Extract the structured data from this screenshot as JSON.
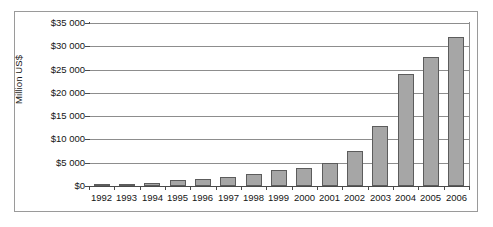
{
  "chart_data": {
    "type": "bar",
    "title": "",
    "subtitle": "",
    "xlabel": "",
    "ylabel": "Million US$",
    "grid": true,
    "legend": false,
    "legend_position": "none",
    "ylim": [
      0,
      35000
    ],
    "y_tick_step": 5000,
    "categories": [
      "1992",
      "1993",
      "1994",
      "1995",
      "1996",
      "1997",
      "1998",
      "1999",
      "2000",
      "2001",
      "2002",
      "2003",
      "2004",
      "2005",
      "2006"
    ],
    "values": [
      100,
      150,
      600,
      1200,
      1400,
      2000,
      2600,
      3400,
      3900,
      5000,
      7500,
      12900,
      24100,
      27600,
      32000
    ],
    "y_tick_labels": [
      "$35 000",
      "$30 000",
      "$25 000",
      "$20 000",
      "$15 000",
      "$10 000",
      "$5 000",
      "$0"
    ],
    "y_tick_values": [
      35000,
      30000,
      25000,
      20000,
      15000,
      10000,
      5000,
      0
    ],
    "bar_color": "#a6a6a6",
    "bar_border_color": "#5c5c5c",
    "gridline_color": "#8d8d8d",
    "axis_color": "#4a4a4a",
    "frame_color": "#9a9a9a",
    "background_color": "#ffffff"
  }
}
